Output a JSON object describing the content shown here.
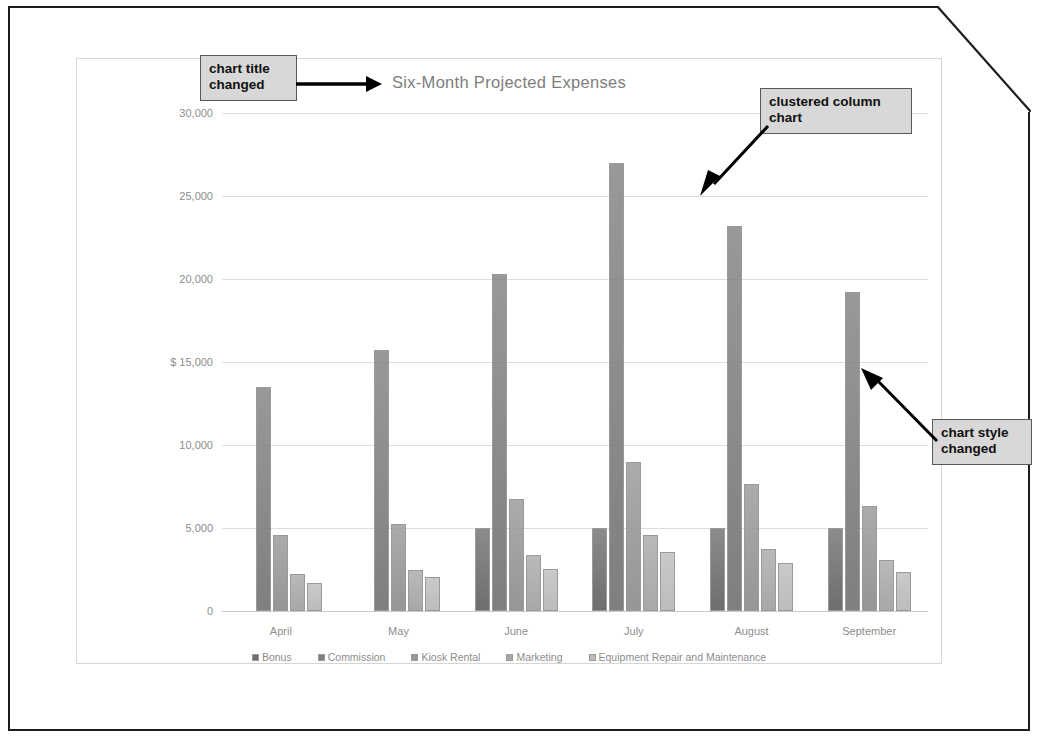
{
  "page": {
    "corner_fold": "dog-ear-top-right"
  },
  "annotations": [
    {
      "id": "chart-title-changed",
      "text": "chart title changed"
    },
    {
      "id": "clustered-column-chart",
      "text": "clustered column chart"
    },
    {
      "id": "chart-style-changed",
      "text": "chart style changed"
    }
  ],
  "chart_data": {
    "type": "bar",
    "title": "Six-Month Projected Expenses",
    "xlabel": "",
    "ylabel": "",
    "ylim": [
      0,
      30000
    ],
    "ytick_values": [
      0,
      5000,
      10000,
      15000,
      20000,
      25000,
      30000
    ],
    "ytick_labels": [
      "0",
      "5,000",
      "10,000",
      "$ 15,000",
      "20,000",
      "25,000",
      "30,000"
    ],
    "currency_symbol": "$",
    "grid": true,
    "legend_position": "bottom",
    "categories": [
      "April",
      "May",
      "June",
      "July",
      "August",
      "September"
    ],
    "series": [
      {
        "name": "Bonus",
        "color": "#6e6e6e",
        "values": [
          0,
          0,
          5000,
          5000,
          5000,
          5000
        ]
      },
      {
        "name": "Commission",
        "color": "#7f7f7f",
        "values": [
          13500,
          15700,
          20300,
          27000,
          23200,
          19200
        ]
      },
      {
        "name": "Kiosk Rental",
        "color": "#969696",
        "values": [
          4600,
          5250,
          6750,
          8950,
          7650,
          6350
        ]
      },
      {
        "name": "Marketing",
        "color": "#a8a8a8",
        "values": [
          2200,
          2450,
          3350,
          4550,
          3750,
          3100
        ]
      },
      {
        "name": "Equipment Repair and Maintenance",
        "color": "#bcbcbc",
        "values": [
          1700,
          2050,
          2550,
          3550,
          2900,
          2350
        ]
      }
    ]
  },
  "colors": {
    "page_border": "#1c1c1c",
    "chart_border": "#d6d6d6",
    "gridline": "#dddddd",
    "title_text": "#7d7d7d",
    "axis_text": "#8d8d8d",
    "callout_fill": "#d8d8d8",
    "callout_border": "#595959",
    "arrow": "#000000"
  }
}
